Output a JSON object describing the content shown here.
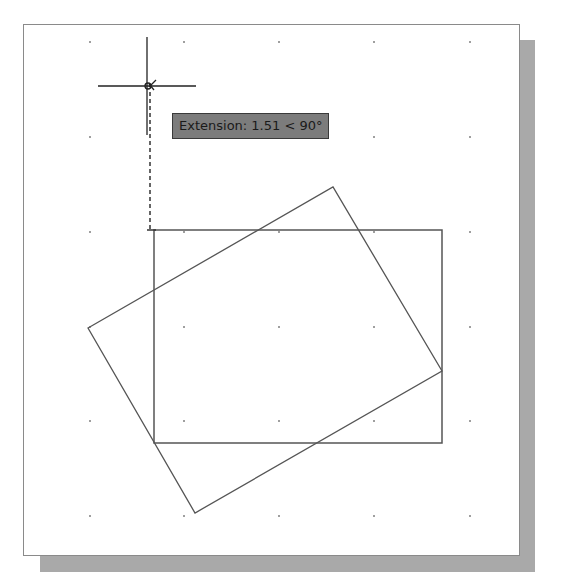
{
  "drawing": {
    "background": "#ffffff",
    "border_color": "#8a8a8a",
    "shadow_color": "#a9a9a9",
    "line_color": "#555555",
    "grid": {
      "columns_x": [
        90,
        184,
        279,
        374,
        470
      ],
      "rows_y": [
        42,
        137,
        232,
        327,
        421,
        516
      ],
      "dot_color": "#6a6a6a"
    },
    "rectangle": {
      "label": "axis-aligned rectangle",
      "x1": 154,
      "y1": 230,
      "x2": 442,
      "y2": 443
    },
    "rotated_rectangle": {
      "label": "rotated rectangle",
      "points": [
        [
          88,
          328
        ],
        [
          333,
          187
        ],
        [
          442,
          371
        ],
        [
          195,
          513
        ]
      ]
    },
    "crosshair": {
      "center_x": 147,
      "center_y": 86,
      "half_length": 49
    },
    "extension_line": {
      "x": 150,
      "y1": 92,
      "y2": 230
    }
  },
  "tooltip": {
    "text": "Extension: 1.51 < 90°",
    "label": "Extension",
    "distance": "1.51",
    "angle": "90°"
  }
}
